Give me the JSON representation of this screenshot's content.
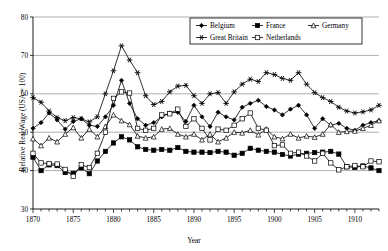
{
  "chart_data": {
    "type": "line",
    "title": "",
    "xlabel": "Year",
    "ylabel": "Relative Real Wage (USA = 100)",
    "xlim": [
      1870,
      1913
    ],
    "ylim": [
      30,
      80
    ],
    "ytick_step": 10,
    "yticks": [
      30,
      40,
      50,
      60,
      70,
      80
    ],
    "xticks": [
      1870,
      1875,
      1880,
      1885,
      1890,
      1895,
      1900,
      1905,
      1910
    ],
    "xtick_minor_step": 1,
    "grid": "horizontal",
    "legend_position": "top-right",
    "x": [
      1870,
      1871,
      1872,
      1873,
      1874,
      1875,
      1876,
      1877,
      1878,
      1879,
      1880,
      1881,
      1882,
      1883,
      1884,
      1885,
      1886,
      1887,
      1888,
      1889,
      1890,
      1891,
      1892,
      1893,
      1894,
      1895,
      1896,
      1897,
      1898,
      1899,
      1900,
      1901,
      1902,
      1903,
      1904,
      1905,
      1906,
      1907,
      1908,
      1909,
      1910,
      1911,
      1912,
      1913
    ],
    "series": [
      {
        "name": "Belgium",
        "marker": "filled-diamond",
        "color": "#000000",
        "values": [
          51.0,
          52.5,
          55.0,
          53.2,
          50.8,
          52.8,
          53.5,
          51.8,
          51.5,
          54.0,
          57.0,
          63.5,
          57.5,
          53.5,
          51.8,
          52.5,
          54.0,
          55.0,
          55.2,
          52.8,
          57.0,
          54.0,
          51.5,
          55.2,
          54.0,
          53.2,
          56.5,
          57.5,
          58.3,
          56.7,
          55.8,
          54.5,
          56.0,
          57.0,
          54.5,
          51.0,
          53.5,
          51.8,
          52.3,
          51.0,
          50.5,
          51.8,
          52.5,
          53.0
        ]
      },
      {
        "name": "France",
        "marker": "filled-square",
        "color": "#000000",
        "values": [
          43.5,
          40.0,
          41.5,
          41.3,
          39.5,
          39.3,
          40.7,
          39.2,
          42.5,
          45.0,
          47.2,
          48.8,
          48.0,
          46.2,
          45.5,
          45.3,
          45.5,
          45.3,
          46.0,
          45.0,
          44.8,
          44.8,
          44.7,
          45.0,
          44.8,
          44.0,
          44.5,
          45.8,
          45.3,
          45.0,
          44.8,
          44.2,
          43.8,
          44.3,
          44.5,
          44.7,
          44.8,
          45.0,
          44.3,
          41.0,
          40.8,
          41.2,
          40.7,
          40.0
        ]
      },
      {
        "name": "Germany",
        "marker": "open-triangle",
        "color": "#000000",
        "values": [
          48.3,
          46.5,
          48.5,
          47.5,
          49.5,
          51.2,
          48.5,
          50.8,
          48.8,
          51.5,
          54.5,
          53.0,
          52.0,
          49.0,
          48.5,
          48.8,
          50.8,
          51.0,
          49.5,
          48.8,
          49.5,
          48.0,
          49.5,
          47.5,
          48.5,
          50.0,
          49.8,
          50.5,
          49.3,
          50.8,
          48.8,
          48.3,
          49.5,
          48.5,
          49.0,
          48.7,
          49.5,
          52.0,
          50.0,
          50.2,
          50.3,
          51.0,
          51.8,
          53.0
        ]
      },
      {
        "name": "Great Britain",
        "marker": "star",
        "color": "#000000",
        "values": [
          59.0,
          57.8,
          55.5,
          53.8,
          53.0,
          53.8,
          53.5,
          52.7,
          54.0,
          60.0,
          66.0,
          72.5,
          68.8,
          65.5,
          59.5,
          57.2,
          58.0,
          60.5,
          62.0,
          62.2,
          59.5,
          57.5,
          60.0,
          60.3,
          57.5,
          60.5,
          62.5,
          63.8,
          63.2,
          65.5,
          65.0,
          64.0,
          63.5,
          65.5,
          62.5,
          60.3,
          59.0,
          58.0,
          56.5,
          55.5,
          55.0,
          55.3,
          55.8,
          57.0
        ]
      },
      {
        "name": "Netherlands",
        "marker": "open-square",
        "color": "#000000",
        "values": [
          44.5,
          42.0,
          41.8,
          41.7,
          40.3,
          38.5,
          41.5,
          40.8,
          44.5,
          50.0,
          58.8,
          60.5,
          60.2,
          51.0,
          50.5,
          51.0,
          54.5,
          54.8,
          56.0,
          51.5,
          53.5,
          51.0,
          48.0,
          50.8,
          50.5,
          51.8,
          53.5,
          55.0,
          51.0,
          50.5,
          46.5,
          46.7,
          44.5,
          44.8,
          43.8,
          42.5,
          44.5,
          42.0,
          40.2,
          41.0,
          41.3,
          41.0,
          42.5,
          42.3
        ]
      }
    ],
    "legend_entries": [
      "Belgium",
      "France",
      "Germany",
      "Great Britain",
      "Netherlands"
    ]
  }
}
